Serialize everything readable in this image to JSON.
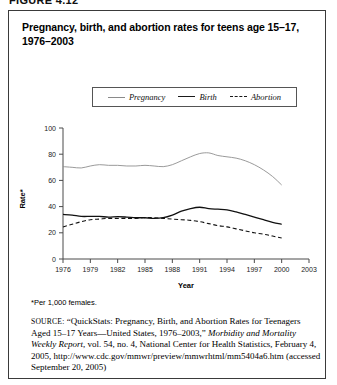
{
  "figure": {
    "label": "FIGURE 4.12",
    "title": "Pregnancy, birth, and abortion rates for teens age 15–17, 1976–2003",
    "footnote": "*Per 1,000 females.",
    "source_prefix": "SOURCE:",
    "source_part1": " “QuickStats: Pregnancy, Birth, and Abortion Rates for Teenagers Aged 15–17 Years—United States, 1976–2003,” ",
    "source_italic1": "Morbidity and Mortality Weekly Report",
    "source_part2": ", vol. 54, no. 4, National Center for Health Statistics, February 4, 2005, http://www.cdc.gov/mmwr/preview/mmwrhtml/mm5404a6.htm (accessed September 20, 2005)"
  },
  "chart_data": {
    "type": "line",
    "title": "Pregnancy, birth, and abortion rates for teens age 15–17, 1976–2003",
    "xlabel": "Year",
    "ylabel": "Rate*",
    "ylim": [
      0,
      100
    ],
    "xlim": [
      1976,
      2003
    ],
    "ytick_labels": [
      "0",
      "20",
      "40",
      "60",
      "80",
      "100"
    ],
    "ytick_values": [
      0,
      20,
      40,
      60,
      80,
      100
    ],
    "xtick_labels": [
      "1976",
      "1979",
      "1982",
      "1985",
      "1988",
      "1991",
      "1994",
      "1997",
      "2000",
      "2003"
    ],
    "xtick_values": [
      1976,
      1979,
      1982,
      1985,
      1988,
      1991,
      1994,
      1997,
      2000,
      2003
    ],
    "grid": false,
    "legend_position": "top-center",
    "x": [
      1976,
      1977,
      1978,
      1979,
      1980,
      1981,
      1982,
      1983,
      1984,
      1985,
      1986,
      1987,
      1988,
      1989,
      1990,
      1991,
      1992,
      1993,
      1994,
      1995,
      1996,
      1997,
      1998,
      1999,
      2000
    ],
    "series": [
      {
        "name": "Pregnancy",
        "style": "solid-thin",
        "color": "#8e8e8e",
        "values": [
          70.5,
          70.0,
          69.5,
          71.0,
          72.0,
          71.5,
          71.5,
          71.0,
          71.0,
          71.5,
          71.0,
          70.5,
          72.0,
          75.0,
          78.0,
          80.5,
          81.0,
          79.0,
          78.0,
          77.0,
          75.0,
          72.0,
          68.0,
          63.0,
          56.5
        ]
      },
      {
        "name": "Birth",
        "style": "solid-thick",
        "color": "#111111",
        "values": [
          34.0,
          33.5,
          32.5,
          32.5,
          32.5,
          32.0,
          32.3,
          32.0,
          31.5,
          31.5,
          31.0,
          31.5,
          33.5,
          36.5,
          38.5,
          39.5,
          38.5,
          38.0,
          37.5,
          36.0,
          34.0,
          32.0,
          30.0,
          28.0,
          26.5
        ]
      },
      {
        "name": "Abortion",
        "style": "dashed",
        "color": "#111111",
        "values": [
          24.5,
          26.5,
          28.5,
          30.0,
          30.5,
          31.0,
          31.0,
          31.0,
          31.0,
          31.5,
          31.5,
          31.0,
          30.5,
          30.0,
          29.5,
          28.5,
          27.0,
          25.5,
          24.5,
          23.0,
          21.5,
          20.0,
          19.0,
          17.5,
          16.0
        ]
      }
    ],
    "series_end_x": 2000
  }
}
